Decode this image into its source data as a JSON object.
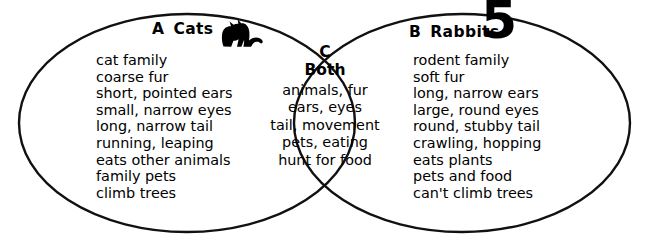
{
  "diagram": {
    "type": "venn-diagram",
    "page_number": "5",
    "background_color": "#ffffff",
    "stroke_color": "#000000",
    "text_color": "#000000"
  },
  "left_set": {
    "letter": "A",
    "label": "Cats",
    "icon": "cat-silhouette-icon",
    "items": [
      "cat family",
      "coarse fur",
      "short, pointed ears",
      "small, narrow eyes",
      "long, narrow tail",
      "running, leaping",
      "eats other animals",
      "family pets",
      "climb trees"
    ]
  },
  "center_set": {
    "letter": "C",
    "label": "Both",
    "items": [
      "animals,  fur",
      "ears,  eyes",
      "tail,  movement",
      "pets,  eating",
      "hunt for food"
    ]
  },
  "right_set": {
    "letter": "B",
    "label": "Rabbits",
    "items": [
      "rodent family",
      "soft fur",
      "long, narrow ears",
      "large, round eyes",
      "round, stubby tail",
      "crawling, hopping",
      "eats plants",
      "pets and food",
      "can't climb trees"
    ]
  }
}
